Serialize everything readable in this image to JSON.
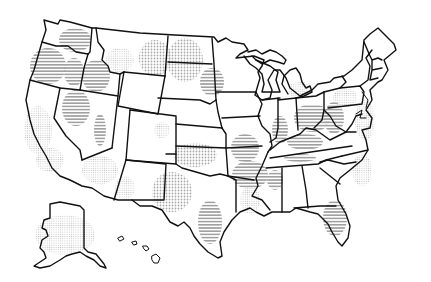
{
  "map": {
    "title": "United States",
    "style": "hand-drawn outline map with halftone textures",
    "colors": {
      "outline": "#111111",
      "stripe": "#9a9a9a",
      "dots": "#a8a8a8",
      "background": "#ffffff"
    },
    "patterns": {
      "stripes": "horizontal-stripe-texture",
      "dots": "halftone-dot-texture"
    },
    "regions": [
      {
        "name": "Washington",
        "texture": "stripes"
      },
      {
        "name": "Oregon",
        "texture": "stripes"
      },
      {
        "name": "Idaho",
        "texture": "stripes"
      },
      {
        "name": "Nevada",
        "texture": "stripes"
      },
      {
        "name": "California",
        "texture": "dots"
      },
      {
        "name": "Montana",
        "texture": "dots"
      },
      {
        "name": "North Dakota",
        "texture": "dots"
      },
      {
        "name": "South Dakota",
        "texture": "dots"
      },
      {
        "name": "Minnesota",
        "texture": "stripes"
      },
      {
        "name": "Kansas",
        "texture": "dots"
      },
      {
        "name": "Arizona",
        "texture": "dots"
      },
      {
        "name": "Texas",
        "texture": "dots"
      },
      {
        "name": "Missouri",
        "texture": "stripes"
      },
      {
        "name": "Arkansas",
        "texture": "stripes"
      },
      {
        "name": "Illinois",
        "texture": "stripes"
      },
      {
        "name": "Indiana",
        "texture": "stripes"
      },
      {
        "name": "Ohio",
        "texture": "stripes"
      },
      {
        "name": "Kentucky",
        "texture": "stripes"
      },
      {
        "name": "West Virginia",
        "texture": "stripes"
      },
      {
        "name": "Mississippi",
        "texture": "stripes"
      },
      {
        "name": "Florida",
        "texture": "stripes"
      },
      {
        "name": "Louisiana",
        "texture": "dots"
      },
      {
        "name": "Pennsylvania",
        "texture": "dots"
      },
      {
        "name": "Maryland",
        "texture": "dots"
      },
      {
        "name": "South Carolina",
        "texture": "dots"
      },
      {
        "name": "Alaska",
        "texture": "dots"
      },
      {
        "name": "Hawaii",
        "texture": "none"
      }
    ]
  }
}
